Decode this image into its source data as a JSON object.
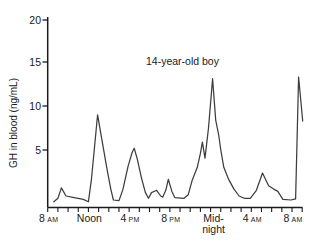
{
  "figure": {
    "annotation": "14-year-old boy",
    "y_axis": {
      "title": "GH in blood (ng/mL)",
      "ticks": [
        20,
        15,
        10,
        5
      ],
      "tick_labels": [
        "20",
        "15",
        "10",
        "5"
      ]
    },
    "x_axis": {
      "span_hours": 25,
      "minor_tick_hours": 1,
      "labels": [
        {
          "t": 0,
          "text": "8",
          "suffix": "AM"
        },
        {
          "t": 4,
          "text": "Noon",
          "suffix": ""
        },
        {
          "t": 8,
          "text": "4",
          "suffix": "PM"
        },
        {
          "t": 12,
          "text": "8",
          "suffix": "PM"
        },
        {
          "t": 16,
          "text": "Mid-",
          "text2": "night",
          "suffix": ""
        },
        {
          "t": 20,
          "text": "4",
          "suffix": "AM"
        },
        {
          "t": 24,
          "text": "8",
          "suffix": "AM"
        }
      ]
    }
  },
  "colors": {
    "background": "#ffffff",
    "axis": "#1a1a1a",
    "line": "#3d3d3d",
    "text": "#1a1a1a"
  },
  "chart_data": {
    "type": "line",
    "title": "",
    "annotation": "14-year-old boy",
    "xlabel": "time of day (8 AM through 8 AM next morning)",
    "ylabel": "GH in blood (ng/mL)",
    "ylim": [
      0,
      20
    ],
    "x_unit": "hours after 8 AM",
    "x_tick_labels": [
      "8 AM",
      "Noon",
      "4 PM",
      "8 PM",
      "Midnight",
      "4 AM",
      "8 AM"
    ],
    "y_tick_values": [
      5,
      10,
      15,
      20
    ],
    "grid": false,
    "legend": "none",
    "series": [
      {
        "name": "GH (14-year-old boy)",
        "x": [
          0.6,
          1.0,
          1.35,
          1.8,
          2.6,
          3.5,
          4.0,
          4.3,
          4.9,
          5.3,
          5.8,
          6.2,
          6.45,
          7.0,
          7.4,
          7.9,
          8.3,
          8.5,
          8.8,
          9.2,
          9.6,
          9.9,
          10.2,
          10.7,
          11.1,
          11.3,
          11.6,
          11.85,
          12.2,
          12.5,
          13.4,
          13.8,
          14.2,
          14.7,
          15.0,
          15.2,
          15.45,
          15.8,
          16.2,
          16.5,
          16.8,
          17.0,
          17.3,
          17.8,
          18.3,
          18.8,
          19.3,
          19.9,
          20.5,
          21.1,
          21.7,
          22.2,
          22.6,
          23.1,
          23.9,
          24.35,
          24.65,
          25.05
        ],
        "y": [
          0.5,
          0.8,
          1.7,
          1.0,
          0.85,
          0.7,
          0.5,
          2.5,
          9.0,
          6.3,
          3.5,
          1.6,
          0.65,
          0.6,
          1.6,
          3.6,
          4.8,
          5.2,
          4.2,
          2.6,
          1.3,
          0.8,
          1.3,
          1.5,
          1.0,
          0.9,
          1.5,
          2.45,
          1.4,
          0.85,
          0.8,
          1.1,
          2.4,
          3.5,
          4.7,
          5.9,
          4.3,
          7.5,
          13.1,
          8.4,
          6.7,
          5.0,
          3.5,
          2.4,
          1.6,
          1.0,
          0.8,
          0.8,
          1.5,
          3.0,
          1.9,
          1.6,
          1.4,
          0.7,
          0.65,
          0.75,
          13.3,
          8.3
        ]
      }
    ]
  }
}
